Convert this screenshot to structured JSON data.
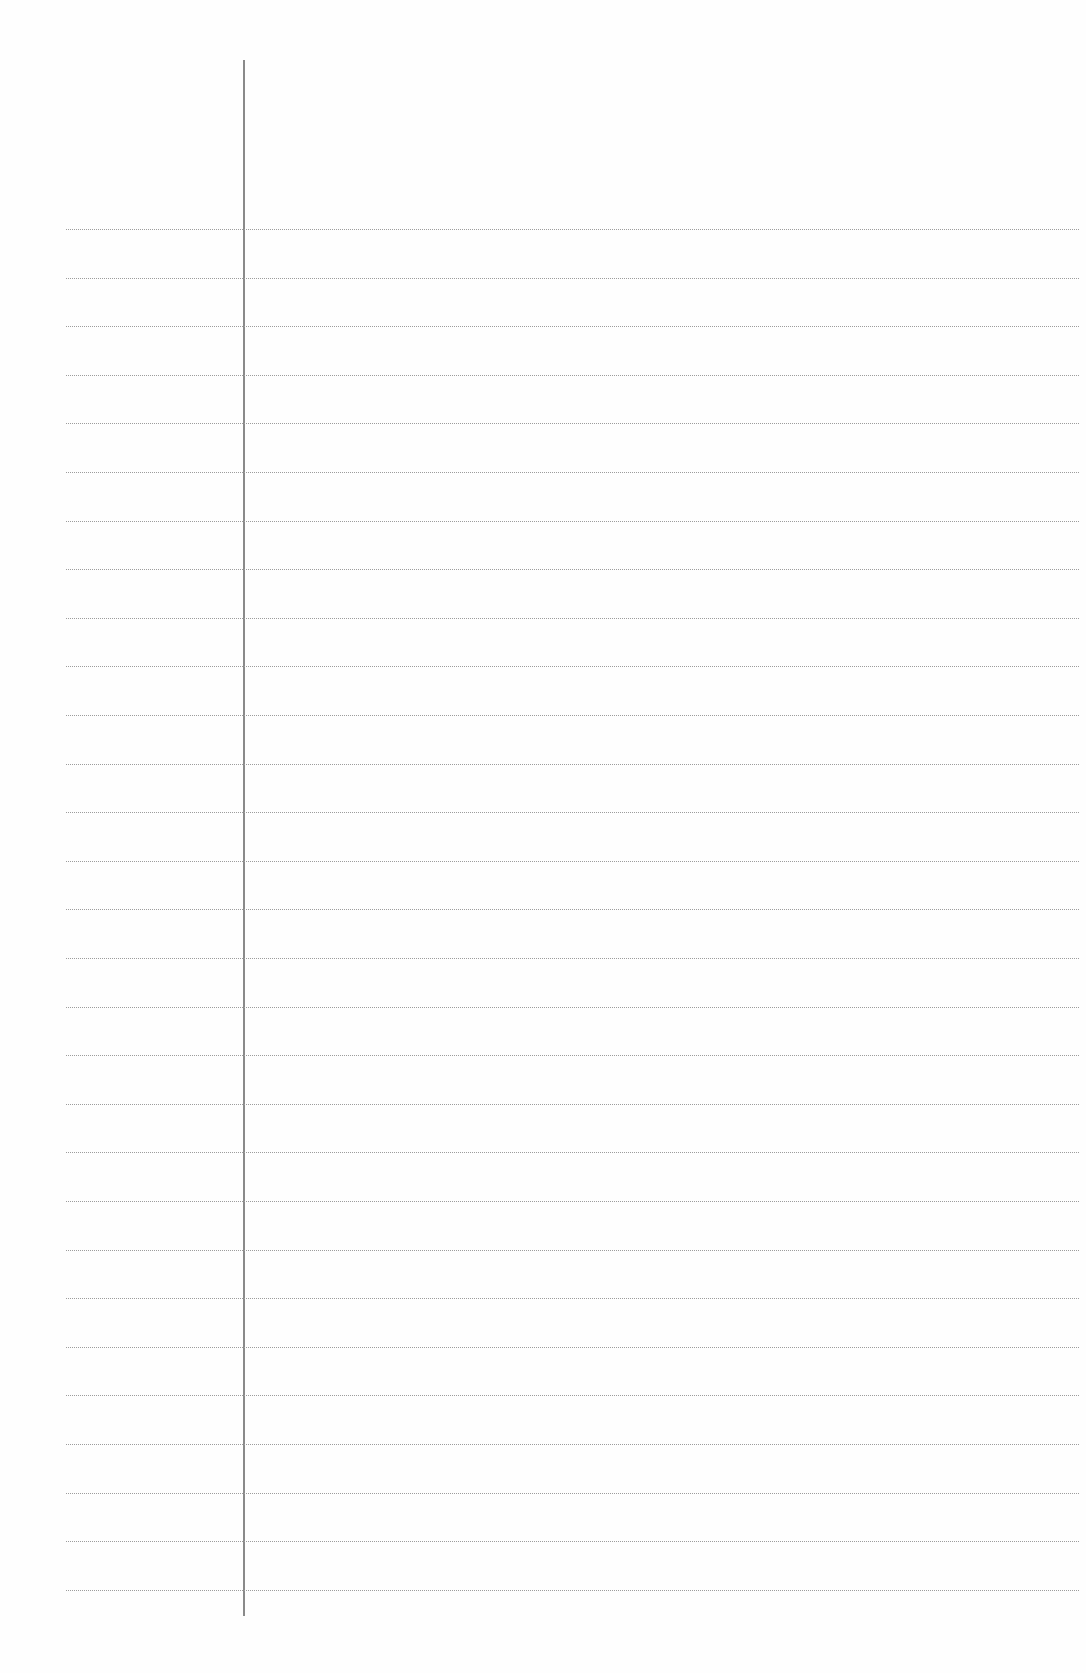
{
  "page": {
    "type": "blank lined notebook page",
    "ruled_lines": {
      "count": 29,
      "first_y": 229,
      "spacing": 48.6,
      "left_x": 66,
      "right_x": 1079,
      "color": "#9c9c9c"
    },
    "margin_line": {
      "x": 243,
      "top_y": 60,
      "bottom_y": 1616,
      "color": "#8a8a8a"
    },
    "background_color": "#fefefe"
  }
}
